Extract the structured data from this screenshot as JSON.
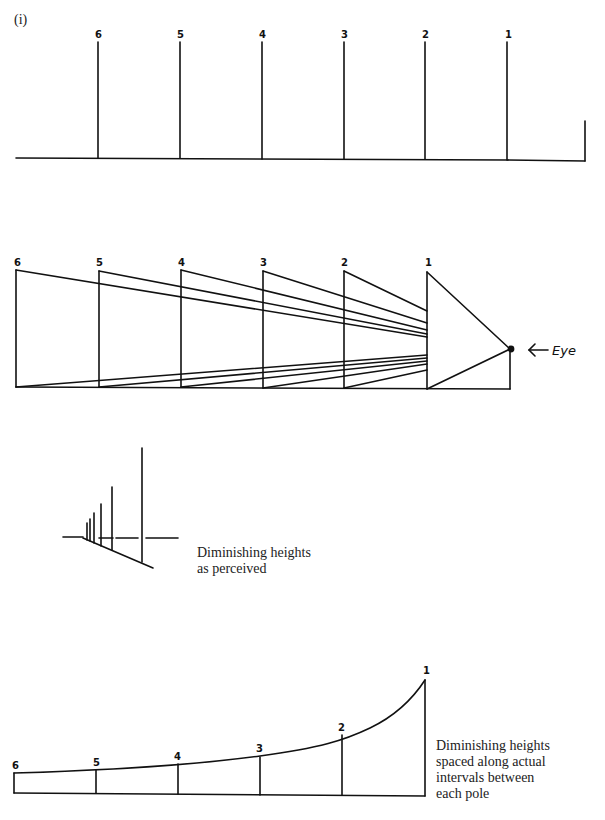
{
  "figure": {
    "label": "(i)"
  },
  "panels": {
    "poles_elevation": {
      "pole_labels": [
        "6",
        "5",
        "4",
        "3",
        "2",
        "1"
      ]
    },
    "sight_lines": {
      "pole_labels": [
        "6",
        "5",
        "4",
        "3",
        "2",
        "1"
      ],
      "eye_label": "Eye",
      "arrow_glyph": "←"
    },
    "perceived": {
      "caption": "Diminishing heights\nas perceived"
    },
    "actual_intervals": {
      "pole_labels": [
        "6",
        "5",
        "4",
        "3",
        "2",
        "1"
      ],
      "caption": "Diminishing heights\nspaced along actual\nintervals between\neach pole"
    }
  },
  "colors": {
    "ink": "#111111",
    "paper": "#ffffff",
    "caption_text": "#222222"
  }
}
